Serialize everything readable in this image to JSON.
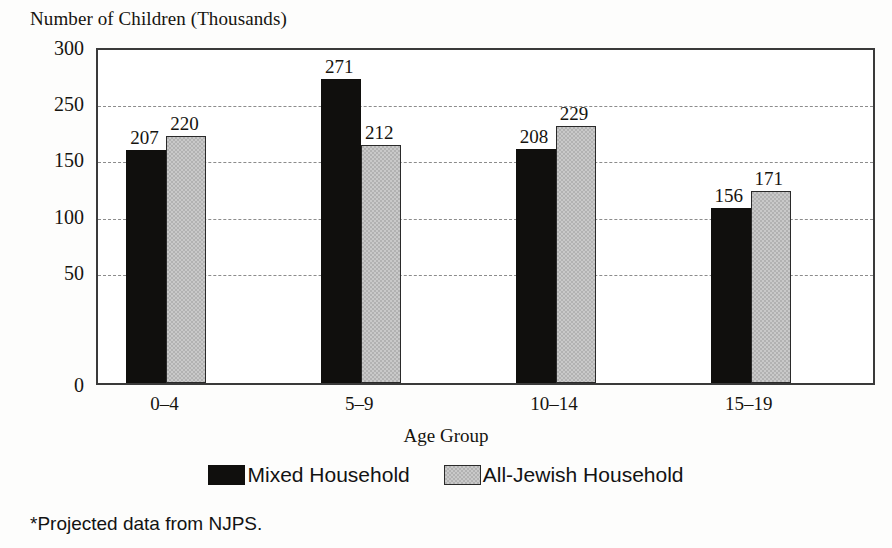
{
  "chart_data": {
    "type": "bar",
    "title": "Number of Children (Thousands)",
    "xlabel": "Age Group",
    "ylabel": "Number of Children (Thousands)",
    "categories": [
      "0–4",
      "5–9",
      "10–14",
      "15–19"
    ],
    "series": [
      {
        "name": "Mixed Household",
        "color": "#100f0d",
        "values": [
          207,
          271,
          208,
          156
        ]
      },
      {
        "name": "All-Jewish Household",
        "color": "#b2b2b2",
        "values": [
          220,
          212,
          229,
          171
        ]
      }
    ],
    "ylim": [
      0,
      300
    ],
    "y_tick_labels": [
      "300",
      "250",
      "150",
      "100",
      "50",
      "0"
    ],
    "y_tick_positions": [
      300,
      250,
      200,
      150,
      100,
      50,
      0
    ],
    "gridlines": true,
    "grid_style": "dashed",
    "legend_position": "bottom",
    "footnote": "*Projected data from NJPS."
  },
  "axis": {
    "y_title": "Number of Children (Thousands)",
    "x_title": "Age Group",
    "ticks": [
      {
        "label": "300",
        "value": 300
      },
      {
        "label": "250",
        "value": 250
      },
      {
        "label": "150",
        "value": 200
      },
      {
        "label": "100",
        "value": 150
      },
      {
        "label": "50",
        "value": 100
      },
      {
        "label": "0",
        "value": 0
      }
    ],
    "grid_values": [
      250,
      200,
      150,
      100
    ]
  },
  "categories": [
    {
      "label": "0–4",
      "bars": [
        {
          "series": "Mixed Household",
          "value": 207,
          "label": "207"
        },
        {
          "series": "All-Jewish Household",
          "value": 220,
          "label": "220"
        }
      ]
    },
    {
      "label": "5–9",
      "bars": [
        {
          "series": "Mixed Household",
          "value": 271,
          "label": "271"
        },
        {
          "series": "All-Jewish Household",
          "value": 212,
          "label": "212"
        }
      ]
    },
    {
      "label": "10–14",
      "bars": [
        {
          "series": "Mixed Household",
          "value": 208,
          "label": "208"
        },
        {
          "series": "All-Jewish Household",
          "value": 229,
          "label": "229"
        }
      ]
    },
    {
      "label": "15–19",
      "bars": [
        {
          "series": "Mixed Household",
          "value": 156,
          "label": "156"
        },
        {
          "series": "All-Jewish Household",
          "value": 171,
          "label": "171"
        }
      ]
    }
  ],
  "legend": {
    "entries": [
      {
        "label": "Mixed Household",
        "swatch": "mixed"
      },
      {
        "label": "All-Jewish Household",
        "swatch": "alljewish"
      }
    ]
  },
  "footnote": {
    "text": "*Projected data from NJPS."
  },
  "colors": {
    "mixed": "#100f0d",
    "all_jewish": "#b2b2b2",
    "axis": "#3a3a3a",
    "grid": "#8c8c8c",
    "text": "#16140f"
  }
}
